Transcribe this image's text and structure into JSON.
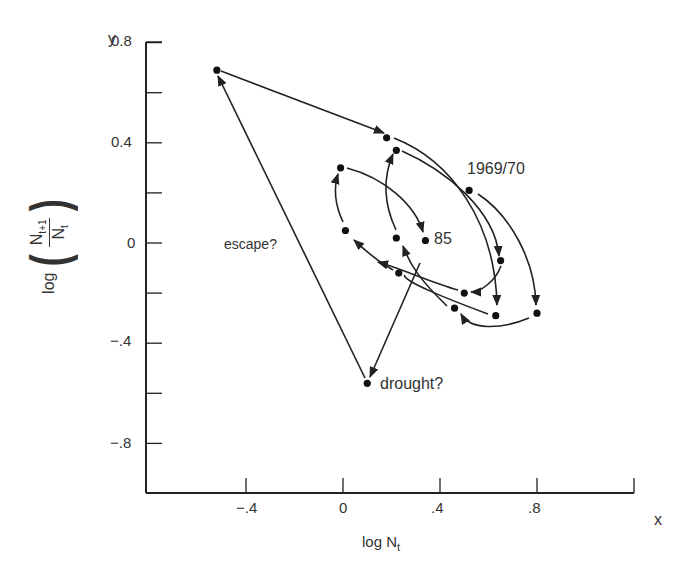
{
  "chart_data": {
    "type": "scatter",
    "title": "",
    "xlabel": "log N_t",
    "ylabel": "log(N_{t+1}/N_t)",
    "x_axis_letter": "x",
    "y_axis_letter": "y",
    "xlim": [
      -0.8,
      1.2
    ],
    "ylim": [
      -1.0,
      0.8
    ],
    "x_ticks": [
      {
        "v": -0.4,
        "label": "-.4"
      },
      {
        "v": 0,
        "label": "0"
      },
      {
        "v": 0.4,
        "label": ".4"
      },
      {
        "v": 0.8,
        "label": ".8"
      },
      {
        "v": 1.2,
        "label": ""
      }
    ],
    "y_ticks": [
      {
        "v": 0.8,
        "label": "0.8"
      },
      {
        "v": 0.6,
        "label": ""
      },
      {
        "v": 0.4,
        "label": "0.4"
      },
      {
        "v": 0.2,
        "label": ""
      },
      {
        "v": 0,
        "label": "0"
      },
      {
        "v": -0.2,
        "label": ""
      },
      {
        "v": -0.4,
        "label": "-.4"
      },
      {
        "v": -0.6,
        "label": ""
      },
      {
        "v": -0.8,
        "label": "-.8"
      }
    ],
    "grid": false,
    "points": [
      {
        "id": "p1969",
        "x": 0.52,
        "y": 0.21
      },
      {
        "id": "a",
        "x": 0.65,
        "y": -0.07
      },
      {
        "id": "b",
        "x": 0.8,
        "y": -0.28
      },
      {
        "id": "c",
        "x": 0.63,
        "y": -0.29
      },
      {
        "id": "d",
        "x": 0.46,
        "y": -0.26
      },
      {
        "id": "e",
        "x": 0.5,
        "y": -0.2
      },
      {
        "id": "f",
        "x": 0.23,
        "y": -0.12
      },
      {
        "id": "g",
        "x": 0.01,
        "y": 0.05
      },
      {
        "id": "h",
        "x": -0.01,
        "y": 0.3
      },
      {
        "id": "p85",
        "x": 0.34,
        "y": 0.01
      },
      {
        "id": "i",
        "x": 0.22,
        "y": 0.02
      },
      {
        "id": "j",
        "x": 0.18,
        "y": 0.42
      },
      {
        "id": "k",
        "x": 0.22,
        "y": 0.37
      },
      {
        "id": "esc",
        "x": -0.52,
        "y": 0.69
      },
      {
        "id": "dry",
        "x": 0.1,
        "y": -0.56
      }
    ],
    "annotations": [
      {
        "text": "1969/70",
        "near": "p1969"
      },
      {
        "text": "85",
        "near": "p85"
      },
      {
        "text": "escape?",
        "near": "escape-line"
      },
      {
        "text": "drought?",
        "near": "dry"
      }
    ]
  },
  "labels": {
    "y_letter": "y",
    "x_letter": "x",
    "xlabel_main": "log N",
    "xlabel_sub": "t",
    "ylabel_log": "log",
    "ylabel_num": "N",
    "ylabel_num_sub": "t+1",
    "ylabel_den": "N",
    "ylabel_den_sub": "t",
    "ann_1969": "1969/70",
    "ann_85": "85",
    "ann_escape": "escape?",
    "ann_drought": "drought?",
    "tick_y_08": "0.8",
    "tick_y_04": "0.4",
    "tick_y_0": "0",
    "tick_y_m04": "−.4",
    "tick_y_m08": "−.8",
    "tick_x_m04": "−.4",
    "tick_x_0": "0",
    "tick_x_04": ".4",
    "tick_x_08": ".8",
    "paren_open": "(",
    "paren_close": ")"
  }
}
